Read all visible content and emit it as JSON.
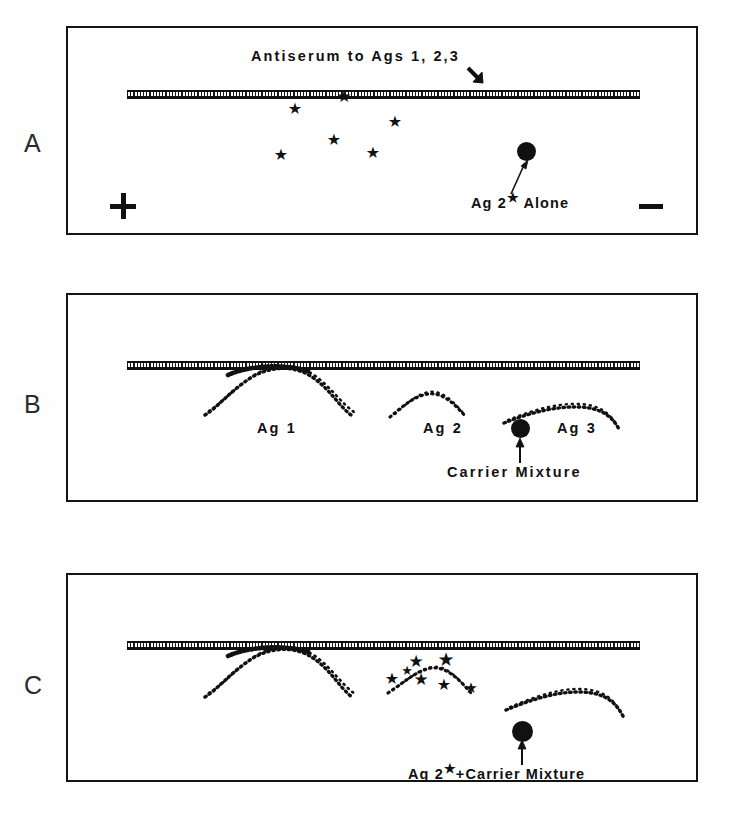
{
  "figure": {
    "type": "immunoelectrophoresis-diagram",
    "background_color": "#fefefe",
    "ink_color": "#111111",
    "panel_count": 3
  },
  "panels": [
    {
      "letter": "A",
      "trough_label": "Antiserum to Ags 1, 2,3",
      "trough_label_has_arrow": true,
      "sample_label_prefix": "Ag 2",
      "sample_label_star": "★",
      "sample_label_suffix": " Alone",
      "polarity_positive": "+",
      "polarity_negative": "−",
      "arc_labels": [],
      "star_count": 6,
      "has_precipitin_arcs": false,
      "description": "Radiolabeled Ag 2 alone: only scattered radioactive stars, no visible precipitin arcs."
    },
    {
      "letter": "B",
      "trough_label": "",
      "arc_labels": [
        "Ag 1",
        "Ag 2",
        "Ag 3"
      ],
      "sample_label": "Carrier Mixture",
      "star_count": 0,
      "has_precipitin_arcs": true,
      "description": "Unlabeled carrier mixture: three dotted precipitin arcs Ag 1, Ag 2, Ag 3."
    },
    {
      "letter": "C",
      "trough_label": "",
      "arc_labels": [],
      "sample_label_prefix": "Ag 2",
      "sample_label_star": "★",
      "sample_label_suffix": "+Carrier Mixture",
      "star_count": 7,
      "has_precipitin_arcs": true,
      "description": "Labeled Ag 2 plus carrier mixture: three arcs, with radioactive stars concentrated on the middle (Ag 2) arc."
    }
  ],
  "icons": {
    "star": "★",
    "arrow_down_right": "arrow-down-right-icon",
    "arrow_up": "arrow-up-icon",
    "sample_dot": "filled-circle-icon"
  }
}
